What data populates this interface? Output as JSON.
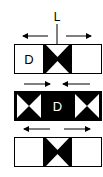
{
  "diagram": {
    "top_label": "L",
    "panels": [
      {
        "id": "panel-1",
        "segment_label": "D",
        "label_segment": "left",
        "arrows": "outward-above",
        "fill": "white-with-black-center-bowtie"
      },
      {
        "id": "panel-2",
        "segment_label": "D",
        "label_segment": "middle",
        "arrows": "inward-above",
        "fill": "black-with-white-side-bowties"
      },
      {
        "id": "panel-3",
        "segment_label": "",
        "arrows": "outward-above",
        "fill": "white-with-black-center-bowtie"
      }
    ],
    "colors": {
      "ink": "#000000",
      "paper": "#ffffff"
    }
  }
}
